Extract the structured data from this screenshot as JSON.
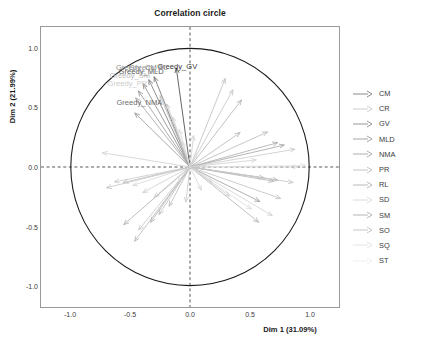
{
  "chart_data": {
    "type": "scatter",
    "title": "Correlation circle",
    "xlabel": "Dim 1 (31.09%)",
    "ylabel": "Dim 2 (21.99%)",
    "xlim": [
      -1.25,
      1.25
    ],
    "ylim": [
      -1.18,
      1.18
    ],
    "xticks": [
      "-1.0",
      "-0.5",
      "0.0",
      "0.5",
      "1.0"
    ],
    "xtick_values": [
      -1.0,
      -0.5,
      0.0,
      0.5,
      1.0
    ],
    "yticks": [
      "1.0",
      "0.5",
      "0.0",
      "-0.5",
      "-1.0"
    ],
    "ytick_values": [
      1.0,
      0.5,
      0.0,
      -0.5,
      -1.0
    ],
    "grid": false,
    "unit_circle": true,
    "origin_crosshair": "dashed",
    "legend_position": "right",
    "legend": [
      {
        "label": "CM",
        "color": "#7d7d7d"
      },
      {
        "label": "CR",
        "color": "#c9c9c9"
      },
      {
        "label": "GV",
        "color": "#8a8a8a"
      },
      {
        "label": "MLD",
        "color": "#9c9c9c"
      },
      {
        "label": "NMA",
        "color": "#a5a5a5"
      },
      {
        "label": "PR",
        "color": "#bdbdbd"
      },
      {
        "label": "RL",
        "color": "#b2b2b2"
      },
      {
        "label": "SD",
        "color": "#d8d8d8"
      },
      {
        "label": "SM",
        "color": "#adadad"
      },
      {
        "label": "SO",
        "color": "#c2c2c2"
      },
      {
        "label": "SQ",
        "color": "#e2e2e2"
      },
      {
        "label": "ST",
        "color": "#ededed"
      }
    ],
    "point_labels": [
      {
        "text": "Greedy_GV",
        "x": -0.115,
        "y": 0.855,
        "color": "#3a3a3a"
      },
      {
        "text": "Greedy_MLD",
        "x": -0.415,
        "y": 0.812,
        "color": "#5a5a5a"
      },
      {
        "text": "Greedy_CM",
        "x": -0.455,
        "y": 0.848,
        "color": "#8c8c8c"
      },
      {
        "text": "Greedy_RL",
        "x": -0.355,
        "y": 0.845,
        "color": "#9a9a9a"
      },
      {
        "text": "Greedy_SM",
        "x": -0.51,
        "y": 0.78,
        "color": "#bdbdbd"
      },
      {
        "text": "Greedy_PR",
        "x": -0.53,
        "y": 0.715,
        "color": "#cccccc"
      },
      {
        "text": "Greedy_NMA",
        "x": -0.43,
        "y": 0.552,
        "color": "#6e6e6e"
      }
    ],
    "arrows": [
      {
        "group": "GV",
        "x": -0.115,
        "y": 0.835,
        "color": "#4a4a4a"
      },
      {
        "group": "CM",
        "x": -0.3,
        "y": 0.76,
        "color": "#6f6f6f"
      },
      {
        "group": "MLD",
        "x": -0.345,
        "y": 0.735,
        "color": "#7d7d7d"
      },
      {
        "group": "RL",
        "x": -0.392,
        "y": 0.7,
        "color": "#8d8d8d"
      },
      {
        "group": "SM",
        "x": -0.432,
        "y": 0.64,
        "color": "#9d9d9d"
      },
      {
        "group": "PR",
        "x": -0.455,
        "y": 0.582,
        "color": "#a9a9a9"
      },
      {
        "group": "NMA",
        "x": -0.462,
        "y": 0.455,
        "color": "#9a9a9a"
      },
      {
        "group": "SD",
        "x": -0.25,
        "y": 0.6,
        "color": "#bcbcbc"
      },
      {
        "group": "SO",
        "x": -0.195,
        "y": 0.53,
        "color": "#c4c4c4"
      },
      {
        "group": "SQ",
        "x": -0.145,
        "y": 0.42,
        "color": "#cfcfcf"
      },
      {
        "group": "ST",
        "x": -0.09,
        "y": 0.315,
        "color": "#d8d8d8"
      },
      {
        "group": "CR",
        "x": -0.06,
        "y": 0.21,
        "color": "#dadada"
      },
      {
        "group": "GV",
        "x": 0.03,
        "y": 0.265,
        "color": "#cfcfcf"
      },
      {
        "group": "CM",
        "x": 0.295,
        "y": 0.745,
        "color": "#c0c0c0"
      },
      {
        "group": "MLD",
        "x": 0.36,
        "y": 0.65,
        "color": "#c6c6c6"
      },
      {
        "group": "NMA",
        "x": 0.432,
        "y": 0.565,
        "color": "#b5b5b5"
      },
      {
        "group": "PR",
        "x": 0.42,
        "y": 0.29,
        "color": "#b9b9b9"
      },
      {
        "group": "RL",
        "x": 0.65,
        "y": 0.295,
        "color": "#bdbdbd"
      },
      {
        "group": "SM",
        "x": 0.735,
        "y": 0.205,
        "color": "#adadad"
      },
      {
        "group": "SO",
        "x": 0.79,
        "y": 0.185,
        "color": "#a8a8a8"
      },
      {
        "group": "SQ",
        "x": 0.88,
        "y": 0.15,
        "color": "#cccccc"
      },
      {
        "group": "ST",
        "x": 0.97,
        "y": 0.012,
        "color": "#e0e0e0"
      },
      {
        "group": "CR",
        "x": 0.905,
        "y": 0.0,
        "color": "#dcdcdc"
      },
      {
        "group": "SD",
        "x": 0.555,
        "y": 0.06,
        "color": "#d2d2d2"
      },
      {
        "group": "CM",
        "x": 0.735,
        "y": -0.11,
        "color": "#b0b0b0"
      },
      {
        "group": "MLD",
        "x": 0.7,
        "y": -0.12,
        "color": "#b6b6b6"
      },
      {
        "group": "NMA",
        "x": 0.62,
        "y": -0.09,
        "color": "#bfbfbf"
      },
      {
        "group": "PR",
        "x": 0.865,
        "y": -0.13,
        "color": "#c9c9c9"
      },
      {
        "group": "RL",
        "x": 0.585,
        "y": -0.29,
        "color": "#a4a4a4"
      },
      {
        "group": "SM",
        "x": 0.76,
        "y": -0.265,
        "color": "#c4c4c4"
      },
      {
        "group": "SO",
        "x": 0.575,
        "y": -0.465,
        "color": "#b8b8b8"
      },
      {
        "group": "SQ",
        "x": 0.69,
        "y": -0.41,
        "color": "#d4d4d4"
      },
      {
        "group": "ST",
        "x": 0.515,
        "y": -0.355,
        "color": "#dddddd"
      },
      {
        "group": "CR",
        "x": 0.33,
        "y": -0.245,
        "color": "#cfcfcf"
      },
      {
        "group": "SD",
        "x": 0.095,
        "y": -0.195,
        "color": "#d6d6d6"
      },
      {
        "group": "GV",
        "x": -0.035,
        "y": -0.295,
        "color": "#c8c8c8"
      },
      {
        "group": "CM",
        "x": -0.175,
        "y": -0.33,
        "color": "#bcbcbc"
      },
      {
        "group": "MLD",
        "x": -0.26,
        "y": -0.4,
        "color": "#c1c1c1"
      },
      {
        "group": "NMA",
        "x": -0.33,
        "y": -0.465,
        "color": "#b4b4b4"
      },
      {
        "group": "PR",
        "x": -0.43,
        "y": -0.53,
        "color": "#c7c7c7"
      },
      {
        "group": "RL",
        "x": -0.465,
        "y": -0.625,
        "color": "#bababa"
      },
      {
        "group": "SM",
        "x": -0.555,
        "y": -0.485,
        "color": "#b1b1b1"
      },
      {
        "group": "SO",
        "x": -0.3,
        "y": -0.255,
        "color": "#cacaca"
      },
      {
        "group": "SQ",
        "x": -0.395,
        "y": -0.215,
        "color": "#d0d0d0"
      },
      {
        "group": "ST",
        "x": -0.48,
        "y": -0.155,
        "color": "#d9d9d9"
      },
      {
        "group": "CR",
        "x": -0.56,
        "y": -0.13,
        "color": "#c3c3c3"
      },
      {
        "group": "SD",
        "x": -0.635,
        "y": -0.125,
        "color": "#cdcdcd"
      },
      {
        "group": "GV",
        "x": -0.7,
        "y": -0.175,
        "color": "#c6c6c6"
      },
      {
        "group": "CM",
        "x": -0.735,
        "y": 0.12,
        "color": "#d2d2d2"
      },
      {
        "group": "MLD",
        "x": -0.1,
        "y": -0.12,
        "color": "#dcdcdc"
      },
      {
        "group": "NMA",
        "x": 0.185,
        "y": -0.13,
        "color": "#d5d5d5"
      },
      {
        "group": "PR",
        "x": 0.06,
        "y": 0.12,
        "color": "#dfdfdf"
      }
    ]
  }
}
